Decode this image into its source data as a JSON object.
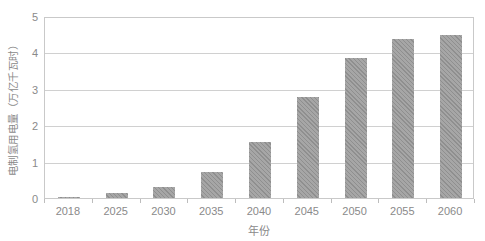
{
  "chart_data": {
    "type": "bar",
    "title": "",
    "categories": [
      "2018",
      "2025",
      "2030",
      "2035",
      "2040",
      "2045",
      "2050",
      "2055",
      "2060"
    ],
    "values": [
      0.02,
      0.13,
      0.3,
      0.72,
      1.55,
      2.77,
      3.85,
      4.37,
      4.47
    ],
    "xlabel": "年份",
    "ylabel": "电制氢用电量（万亿千瓦时）",
    "ylim": [
      0,
      5
    ],
    "yticks": [
      0,
      1,
      2,
      3,
      4,
      5
    ],
    "grid": true,
    "legend_position": "none",
    "bar_hatch_light": "#a6a6a6",
    "bar_hatch_dark": "#8f8f8f",
    "axis_border_color": "#c9c9c9",
    "gridline_color": "#d0d0d0",
    "tick_mark_color": "#bdbdbd",
    "label_color": "#8a8a8a"
  }
}
